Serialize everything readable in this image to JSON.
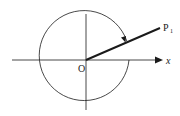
{
  "diagram": {
    "labels": {
      "origin": "O",
      "x_axis": "x",
      "point": "P",
      "point_subscript": "1"
    },
    "colors": {
      "stroke": "#1a1a1a",
      "background": "#ffffff"
    }
  }
}
